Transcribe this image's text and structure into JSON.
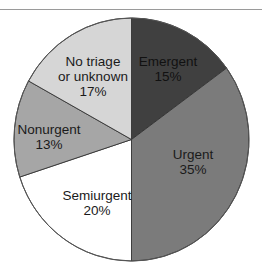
{
  "chart_data": {
    "type": "pie",
    "title": "",
    "start_angle_deg": 0,
    "direction": "clockwise",
    "slices": [
      {
        "label": "Emergent",
        "value": 15,
        "display": "15%",
        "color": "#404040"
      },
      {
        "label": "Urgent",
        "value": 35,
        "display": "35%",
        "color": "#7b7b7b"
      },
      {
        "label": "Semiurgent",
        "value": 20,
        "display": "20%",
        "color": "#ffffff"
      },
      {
        "label": "Nonurgent",
        "value": 13,
        "display": "13%",
        "color": "#a6a6a6"
      },
      {
        "label": "No triage or unknown",
        "value": 17,
        "display": "17%",
        "color": "#d6d6d6"
      }
    ],
    "legend": "none (labels inside slices)"
  },
  "labels": {
    "emergent": {
      "line1": "Emergent",
      "line2": "15%"
    },
    "urgent": {
      "line1": "Urgent",
      "line2": "35%"
    },
    "semiurgent": {
      "line1": "Semiurgent",
      "line2": "20%"
    },
    "nonurgent": {
      "line1": "Nonurgent",
      "line2": "13%"
    },
    "notriage": {
      "line1": "No triage",
      "line2": "or unknown",
      "line3": "17%"
    }
  }
}
